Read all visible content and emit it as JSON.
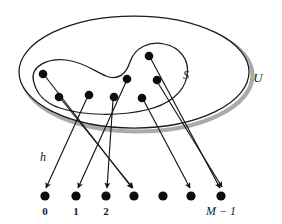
{
  "figure": {
    "colors": {
      "stroke": "#1a1a1a",
      "dot": "#0d0d0d",
      "shadow": "#a8a8a8",
      "background": "#ffffff"
    },
    "labels": {
      "universe": "U",
      "subset": "S",
      "function": "h"
    },
    "universe_ellipse": {
      "cx": 134,
      "cy": 72,
      "rx": 115,
      "ry": 56
    },
    "subset_blob_label_pos": {
      "x": 186,
      "y": 79
    },
    "universe_label_pos": {
      "x": 258,
      "y": 82
    },
    "function_label_pos": {
      "x": 43,
      "y": 161
    },
    "keys": [
      {
        "id": "k0",
        "x": 43,
        "y": 74
      },
      {
        "id": "k1",
        "x": 59,
        "y": 97
      },
      {
        "id": "k2",
        "x": 89,
        "y": 95
      },
      {
        "id": "k3",
        "x": 149,
        "y": 56
      },
      {
        "id": "k4",
        "x": 127,
        "y": 79
      },
      {
        "id": "k5",
        "x": 157,
        "y": 80
      },
      {
        "id": "k6",
        "x": 114,
        "y": 97
      },
      {
        "id": "k7",
        "x": 142,
        "y": 98
      }
    ],
    "slots": [
      {
        "id": "s0",
        "x": 45,
        "y": 196,
        "label": "0"
      },
      {
        "id": "s1",
        "x": 76,
        "y": 196,
        "label": "1"
      },
      {
        "id": "s2",
        "x": 106,
        "y": 196,
        "label": "2"
      },
      {
        "id": "s3",
        "x": 134,
        "y": 196,
        "label": ""
      },
      {
        "id": "s4",
        "x": 163,
        "y": 196,
        "label": ""
      },
      {
        "id": "s5",
        "x": 191,
        "y": 196,
        "label": ""
      },
      {
        "id": "s6",
        "x": 221,
        "y": 196,
        "label": "M − 1"
      }
    ],
    "mapping": [
      {
        "from": "k0",
        "to": "s3"
      },
      {
        "from": "k1",
        "to": "s3"
      },
      {
        "from": "k2",
        "to": "s0"
      },
      {
        "from": "k3",
        "to": "s6"
      },
      {
        "from": "k4",
        "to": "s1"
      },
      {
        "from": "k5",
        "to": "s6"
      },
      {
        "from": "k6",
        "to": "s2"
      },
      {
        "from": "k7",
        "to": "s5"
      }
    ],
    "slot_labels": [
      "0",
      "1",
      "2",
      "M − 1"
    ]
  }
}
